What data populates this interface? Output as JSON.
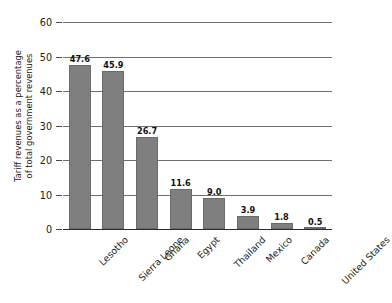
{
  "chart_data": {
    "type": "bar",
    "title": "",
    "subtitle": "",
    "xlabel": "",
    "ylabel": "Tariff revenues as a percentage of total government revenues",
    "ylabel_lines": [
      "Tariff revenues as a percentage",
      "of total government revenues"
    ],
    "categories": [
      "Lesotho",
      "Sierra Leone",
      "Ghana",
      "Egypt",
      "Thailand",
      "Mexico",
      "Canada",
      "United States"
    ],
    "values": [
      47.6,
      45.9,
      26.7,
      11.6,
      9.0,
      3.9,
      1.8,
      0.5
    ],
    "value_labels": [
      "47.6",
      "45.9",
      "26.7",
      "11.6",
      "9.0",
      "3.9",
      "1.8",
      "0.5"
    ],
    "ylim": [
      0,
      60
    ],
    "yticks": [
      0,
      10,
      20,
      30,
      40,
      50,
      60
    ],
    "ytick_labels": [
      "0",
      "10",
      "20",
      "30",
      "40",
      "50",
      "60"
    ],
    "grid": "horizontal",
    "legend": "none",
    "bar_color": "#7f7f7f",
    "gridline_color": "#6e6e6e",
    "axis_color": "#2b2b2b",
    "background_color": "#ffffff"
  }
}
